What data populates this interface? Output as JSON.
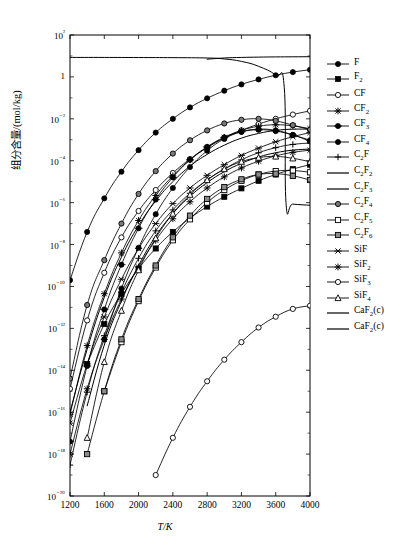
{
  "chart_data": {
    "type": "line",
    "title": "",
    "xlabel": "T/K",
    "ylabel": "组分含量/(mol/kg)",
    "yscale": "log",
    "xlim": [
      1200,
      4000
    ],
    "ylim": [
      1e-20,
      100
    ],
    "grid": false,
    "legend_position": "right",
    "xticks": [
      1200,
      1600,
      2000,
      2400,
      2800,
      3200,
      3600,
      4000
    ],
    "xtick_labels": [
      "1200",
      "1600",
      "2000",
      "2400",
      "2800",
      "3200",
      "3600",
      "4000"
    ],
    "ytick_labels": [
      "10²",
      "1",
      "10⁻²",
      "10⁻⁴",
      "10⁻⁶",
      "10⁻⁸",
      "10⁻¹⁰",
      "10⁻¹²",
      "10⁻¹⁴",
      "10⁻¹⁶",
      "10⁻¹⁸",
      "10⁻²⁰"
    ],
    "ytick_values": [
      100,
      1,
      0.01,
      0.0001,
      1e-06,
      1e-08,
      1e-10,
      1e-12,
      1e-14,
      1e-16,
      1e-18,
      1e-20
    ],
    "series": [
      {
        "name": "F",
        "label": "F",
        "marker": "filled-circle",
        "x": [
          1200,
          1400,
          1600,
          1800,
          2000,
          2200,
          2400,
          2600,
          2800,
          3000,
          3200,
          3400,
          3600,
          3800,
          4000
        ],
        "y": [
          2e-10,
          4e-08,
          1.6e-06,
          3e-05,
          0.00032,
          0.0022,
          0.01,
          0.035,
          0.095,
          0.22,
          0.44,
          0.76,
          1.2,
          1.7,
          2.2
        ]
      },
      {
        "name": "F2",
        "label": "F₂",
        "marker": "filled-square",
        "x": [
          1400,
          1600,
          1800,
          2000,
          2200,
          2400,
          2600,
          2800,
          3000,
          3200,
          3400,
          3600,
          3800,
          4000
        ],
        "y": [
          2e-14,
          1.6e-12,
          4.5e-11,
          7e-10,
          6.5e-09,
          4e-08,
          1.8e-07,
          6.5e-07,
          1.9e-06,
          4.8e-06,
          1.1e-05,
          2.2e-05,
          4e-05,
          6.5e-05
        ]
      },
      {
        "name": "CF",
        "label": "CF",
        "marker": "open-circle",
        "x": [
          1200,
          1400,
          1600,
          1800,
          2000,
          2200,
          2400,
          2600,
          2800,
          3000,
          3200,
          3400,
          3600,
          3800,
          4000
        ],
        "y": [
          1.3e-15,
          2.4e-12,
          4.5e-10,
          2.2e-08,
          4e-07,
          4e-06,
          2.6e-05,
          0.00012,
          0.00042,
          0.0012,
          0.0028,
          0.0056,
          0.01,
          0.016,
          0.024
        ]
      },
      {
        "name": "CF2",
        "label": "CF₂",
        "marker": "star",
        "x": [
          1200,
          1400,
          1600,
          1800,
          2000,
          2200,
          2400,
          2600,
          2800,
          3000,
          3200,
          3400,
          3600,
          3800,
          4000
        ],
        "y": [
          8e-17,
          1.5e-13,
          4.5e-11,
          4e-09,
          1.4e-07,
          2.2e-06,
          1.9e-05,
          0.00011,
          0.00043,
          0.0013,
          0.0028,
          0.0044,
          0.0052,
          0.0046,
          0.0034
        ]
      },
      {
        "name": "CF3",
        "label": "CF₃",
        "marker": "filled-hex",
        "x": [
          1200,
          1400,
          1600,
          1800,
          2000,
          2200,
          2400,
          2600,
          2800,
          3000,
          3200,
          3400,
          3600,
          3800,
          4000
        ],
        "y": [
          4e-18,
          1.6e-14,
          8e-12,
          1.1e-09,
          6e-08,
          1.4e-06,
          1.6e-05,
          0.00011,
          0.00046,
          0.0013,
          0.0024,
          0.003,
          0.0026,
          0.0017,
          0.00095
        ]
      },
      {
        "name": "CF4",
        "label": "CF₄",
        "marker": "filled-circle",
        "x": [
          1600,
          1800,
          2000,
          2200,
          2400,
          2600,
          2800,
          3000,
          3200,
          3400,
          3600,
          3800,
          4000
        ],
        "y": [
          3e-13,
          8e-11,
          7e-09,
          2.8e-07,
          5e-06,
          5e-05,
          0.0003,
          0.0011,
          0.0024,
          0.0032,
          0.0028,
          0.0017,
          0.00085
        ]
      },
      {
        "name": "C2F",
        "label": "C₂F",
        "marker": "plus",
        "x": [
          1200,
          1400,
          1600,
          1800,
          2000,
          2200,
          2400,
          2600,
          2800,
          3000,
          3200,
          3400,
          3600,
          3800,
          4000
        ],
        "y": [
          3e-19,
          9e-16,
          4.5e-13,
          5e-11,
          2.2e-09,
          4.5e-08,
          4.5e-07,
          2.8e-06,
          1.2e-05,
          4e-05,
          0.00011,
          0.00024,
          0.00042,
          0.0006,
          0.0007
        ]
      },
      {
        "name": "C2F2",
        "label": "C₂F₂",
        "marker": "none",
        "x": [
          1200,
          1400,
          1600,
          1800,
          2000,
          2200,
          2400,
          2600,
          2800,
          3000,
          3200,
          3400,
          3600,
          3800,
          4000
        ],
        "y": [
          1e-16,
          1e-13,
          3e-11,
          2.5e-09,
          8e-08,
          1.2e-06,
          1e-05,
          5.5e-05,
          0.0002,
          0.00055,
          0.0012,
          0.002,
          0.0028,
          0.0032,
          0.0032
        ]
      },
      {
        "name": "C2F3",
        "label": "C₂F₃",
        "marker": "none",
        "x": [
          1400,
          1600,
          1800,
          2000,
          2200,
          2400,
          2600,
          2800,
          3000,
          3200,
          3400,
          3600,
          3800,
          4000
        ],
        "y": [
          2e-16,
          1.6e-13,
          2e-11,
          1e-09,
          2.5e-08,
          3e-07,
          2e-06,
          9e-06,
          3e-05,
          7.5e-05,
          0.00015,
          0.00024,
          0.00032,
          0.00036
        ]
      },
      {
        "name": "C2F4",
        "label": "C₂F₄",
        "marker": "gray-circle",
        "x": [
          1200,
          1400,
          1600,
          1800,
          2000,
          2200,
          2400,
          2600,
          2800,
          3000,
          3200,
          3400,
          3600,
          3800,
          4000
        ],
        "y": [
          4e-15,
          1.3e-11,
          1.8e-09,
          1e-07,
          2.6e-06,
          3.2e-05,
          0.00022,
          0.00095,
          0.0028,
          0.006,
          0.009,
          0.01,
          0.008,
          0.005,
          0.003
        ]
      },
      {
        "name": "C2F5",
        "label": "C₂F₅",
        "marker": "open-square",
        "x": [
          1600,
          1800,
          2000,
          2200,
          2400,
          2600,
          2800,
          3000,
          3200,
          3400,
          3600,
          3800,
          4000
        ],
        "y": [
          1e-15,
          2.2e-13,
          2e-11,
          8e-10,
          1.6e-08,
          1.6e-07,
          1e-06,
          4e-06,
          1.1e-05,
          2.2e-05,
          3.2e-05,
          3.4e-05,
          2.8e-05
        ]
      },
      {
        "name": "C2F6",
        "label": "C₂F₆",
        "marker": "gray-square",
        "x": [
          1400,
          1600,
          1800,
          2000,
          2200,
          2400,
          2600,
          2800,
          3000,
          3200,
          3400,
          3600,
          3800,
          4000
        ],
        "y": [
          1e-18,
          1e-15,
          3e-13,
          2.5e-11,
          1e-09,
          2.2e-08,
          2.4e-07,
          1.5e-06,
          5.5e-06,
          1.3e-05,
          2.2e-05,
          2.4e-05,
          1.9e-05,
          1.2e-05
        ]
      },
      {
        "name": "SiF",
        "label": "SiF",
        "marker": "x-cross",
        "x": [
          1200,
          1400,
          1600,
          1800,
          2000,
          2200,
          2400,
          2600,
          2800,
          3000,
          3200,
          3400,
          3600,
          3800,
          4000
        ],
        "y": [
          3e-17,
          2e-14,
          3.5e-12,
          2.2e-10,
          6.5e-09,
          1e-07,
          9e-07,
          5e-06,
          2e-05,
          6.5e-05,
          0.00018,
          0.0004,
          0.0008,
          0.0014,
          0.0022
        ]
      },
      {
        "name": "SiF2",
        "label": "SiF₂",
        "marker": "star",
        "x": [
          1200,
          1400,
          1600,
          1800,
          2000,
          2200,
          2400,
          2600,
          2800,
          3000,
          3200,
          3400,
          3600,
          3800,
          4000
        ],
        "y": [
          1e-18,
          1.3e-15,
          3e-13,
          2.5e-11,
          8.5e-10,
          1.6e-08,
          1.7e-07,
          1.1e-06,
          5e-06,
          1.7e-05,
          4.5e-05,
          9.5e-05,
          0.00017,
          0.00025,
          0.00032
        ]
      },
      {
        "name": "SiF3",
        "label": "SiF₃",
        "marker": "open-circle",
        "x": [
          2200,
          2400,
          2600,
          2800,
          3000,
          3200,
          3400,
          3600,
          3800,
          4000
        ],
        "y": [
          1e-19,
          6e-18,
          1.8e-16,
          3e-15,
          3.2e-14,
          2.2e-13,
          1.1e-12,
          3.6e-12,
          8.5e-12,
          1.2e-11
        ]
      },
      {
        "name": "SiF4",
        "label": "SiF₄",
        "marker": "open-triangle",
        "x": [
          1400,
          1600,
          1800,
          2000,
          2200,
          2400,
          2600,
          2800,
          3000,
          3200,
          3400,
          3600,
          3800,
          4000
        ],
        "y": [
          6e-18,
          2.5e-14,
          7e-12,
          6e-10,
          2e-08,
          3e-07,
          2.4e-06,
          1.2e-05,
          4e-05,
          9e-05,
          0.00014,
          0.00016,
          0.00013,
          9e-05
        ]
      },
      {
        "name": "CaF2_c_1",
        "label": "CaF₂(c)",
        "marker": "none",
        "x": [
          1200,
          1600,
          2000,
          2400,
          2800,
          3000,
          3200,
          3400,
          3600,
          3700,
          3720,
          3800,
          4000
        ],
        "y": [
          8.5,
          8.5,
          8.4,
          8.3,
          8.0,
          7.2,
          5.5,
          3.2,
          1.2,
          0.3,
          1e-06,
          8.5e-07,
          7.5e-07
        ]
      },
      {
        "name": "CaF2_c_2",
        "label": "CaF₂(c)",
        "marker": "none",
        "x": [
          2800,
          3000,
          3200,
          3400,
          3600,
          3800,
          4000
        ],
        "y": [
          7.0,
          8.0,
          8.5,
          8.8,
          9.0,
          9.1,
          9.2
        ]
      }
    ]
  },
  "axis": {
    "ylabel": "组分含量/(mol/kg)",
    "xlabel": "T/K"
  },
  "legend": {
    "items": [
      {
        "label": "F",
        "marker": "filled-circle"
      },
      {
        "label": "F",
        "sub": "2",
        "marker": "filled-square"
      },
      {
        "label": "CF",
        "marker": "open-circle"
      },
      {
        "label": "CF",
        "sub": "2",
        "marker": "star"
      },
      {
        "label": "CF",
        "sub": "3",
        "marker": "filled-hex"
      },
      {
        "label": "CF",
        "sub": "4",
        "marker": "filled-circle"
      },
      {
        "label": "C",
        "sub": "2",
        "label2": "F",
        "marker": "plus"
      },
      {
        "label": "C",
        "sub": "2",
        "label2": "F",
        "sub2": "2",
        "marker": "none"
      },
      {
        "label": "C",
        "sub": "2",
        "label2": "F",
        "sub2": "3",
        "marker": "none"
      },
      {
        "label": "C",
        "sub": "2",
        "label2": "F",
        "sub2": "4",
        "marker": "gray-circle"
      },
      {
        "label": "C",
        "sub": "2",
        "label2": "F",
        "sub2": "5",
        "marker": "open-square"
      },
      {
        "label": "C",
        "sub": "2",
        "label2": "F",
        "sub2": "6",
        "marker": "gray-square"
      },
      {
        "label": "SiF",
        "marker": "x-cross"
      },
      {
        "label": "SiF",
        "sub": "2",
        "marker": "star"
      },
      {
        "label": "SiF",
        "sub": "3",
        "marker": "open-circle"
      },
      {
        "label": "SiF",
        "sub": "4",
        "marker": "open-triangle"
      },
      {
        "label": "CaF",
        "sub": "2",
        "label2": "(c)",
        "marker": "none"
      },
      {
        "label": "CaF",
        "sub": "2",
        "label2": "(c)",
        "marker": "none"
      }
    ]
  }
}
